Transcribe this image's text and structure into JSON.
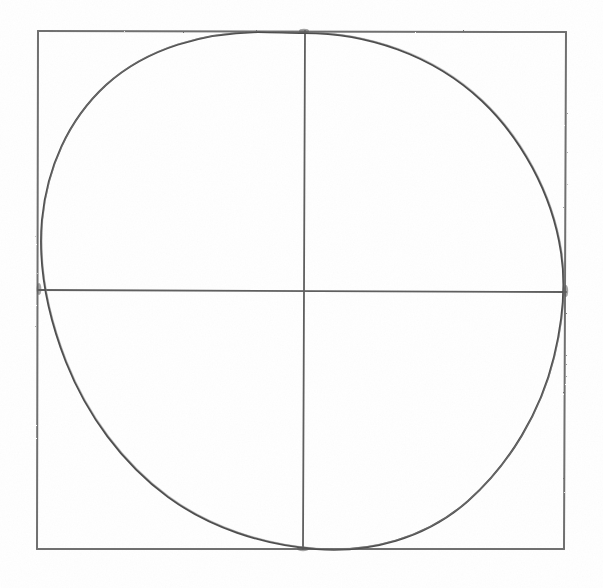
{
  "artwork": {
    "title": "Hand-drawn circle inscribed in a square",
    "medium": "pencil on white paper",
    "caption": "",
    "background_color": "#ffffff"
  },
  "colors": {
    "paper": "#ffffff",
    "square_stroke": "#6f6f6f",
    "axis_stroke": "#5f5f5f",
    "circle_stroke": "#4e4e4e",
    "grain": "#cfcfcf"
  },
  "canvas": {
    "width": 603,
    "height": 588
  },
  "square": {
    "label": "bounding square",
    "left": 38,
    "top": 31,
    "right": 566,
    "bottom": 549,
    "width": 528,
    "height": 518,
    "stroke_width": 2.0
  },
  "axes": {
    "vertical_label": "vertical midline",
    "vertical_x": 304,
    "vertical_top": 31,
    "vertical_bottom": 549,
    "horizontal_label": "horizontal midline",
    "horizontal_y": 290,
    "horizontal_left": 38,
    "horizontal_right": 566,
    "stroke_width": 1.8
  },
  "circle": {
    "label": "inscribed circle",
    "center_x": 302,
    "center_y": 290,
    "radius_x": 264,
    "radius_y": 259,
    "stroke_width": 2.0,
    "tangent_points": [
      {
        "name": "top",
        "x": 304,
        "y": 31
      },
      {
        "name": "right",
        "x": 566,
        "y": 291
      },
      {
        "name": "bottom",
        "x": 303,
        "y": 549
      },
      {
        "name": "left",
        "x": 39,
        "y": 289
      }
    ],
    "path": "M 304 33 C 366 33 432 54 482 101 C 520 137 552 192 561 252 C 566 284 563 320 554 357 C 541 411 510 464 468 501 C 425 539 369 553 316 549 C 262 545 209 527 168 497 C 122 463 87 415 66 362 C 48 316 38 266 42 220 C 47 168 68 120 106 85 C 148 47 205 33 258 32 C 273 32 290 33 304 33 Z"
  },
  "annotations": []
}
